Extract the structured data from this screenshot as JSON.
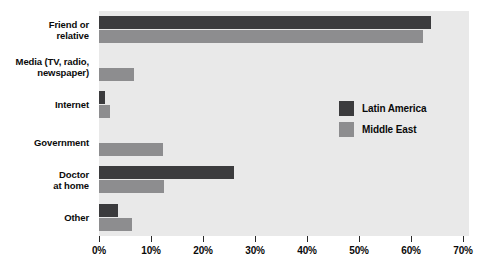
{
  "chart_data": {
    "type": "bar",
    "orientation": "horizontal",
    "title": "",
    "xlabel": "",
    "ylabel": "",
    "xlim": [
      0,
      70
    ],
    "xticks": [
      0,
      10,
      20,
      30,
      40,
      50,
      60,
      70
    ],
    "xtick_labels": [
      "0%",
      "10%",
      "20%",
      "30%",
      "40%",
      "50%",
      "60%",
      "70%"
    ],
    "grid": false,
    "legend_position": "inside-right",
    "categories": [
      "Friend or relative",
      "Media (TV, radio, newspaper)",
      "Internet",
      "Government",
      "Doctor at home",
      "Other"
    ],
    "category_lines": [
      [
        "Friend or",
        "relative"
      ],
      [
        "Media (TV, radio,",
        "newspaper)"
      ],
      [
        "Internet"
      ],
      [
        "Government"
      ],
      [
        "Doctor",
        "at home"
      ],
      [
        "Other"
      ]
    ],
    "series": [
      {
        "name": "Latin America",
        "color": "#3b3b3d",
        "values": [
          63.8,
          0,
          1.2,
          0,
          26.0,
          3.7
        ]
      },
      {
        "name": "Middle East",
        "color": "#8d8d8f",
        "values": [
          62.3,
          6.7,
          2.1,
          12.3,
          12.5,
          6.3
        ]
      }
    ]
  },
  "legend": {
    "items": [
      {
        "label": "Latin America",
        "color": "#3b3b3d"
      },
      {
        "label": "Middle East",
        "color": "#8d8d8f"
      }
    ]
  },
  "colors": {
    "plot_background": "#e9e9e9",
    "page_background": "#ffffff",
    "axis": "#2a2a2a",
    "text": "#0a0a0a",
    "latin_america": "#3b3b3d",
    "middle_east": "#8d8d8f"
  }
}
